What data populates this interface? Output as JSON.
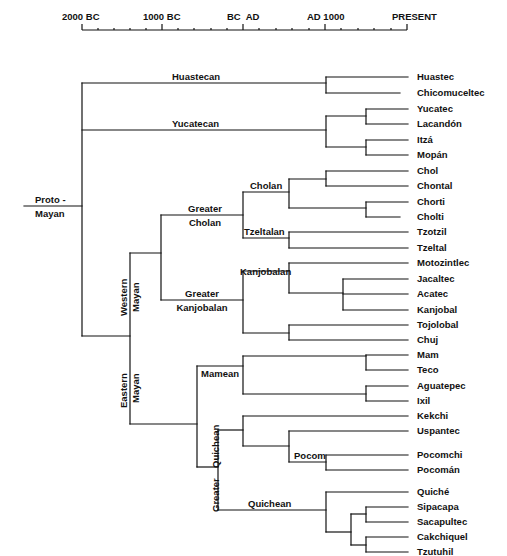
{
  "timeline": {
    "ticks": [
      {
        "label": "2000 BC",
        "x": 82
      },
      {
        "label": "1000 BC",
        "x": 162
      },
      {
        "label": "BC  AD",
        "x": 243
      },
      {
        "label": "AD 1000",
        "x": 325
      },
      {
        "label": "PRESENT",
        "x": 407
      }
    ],
    "minor_tick_count_per_interval": 5
  },
  "root": {
    "label_line1": "Proto -",
    "label_line2": "Mayan"
  },
  "branches": {
    "huastecan": "Huastecan",
    "yucatecan": "Yucatecan",
    "western_mayan_line1": "Western",
    "western_mayan_line2": "Mayan",
    "eastern_mayan_line1": "Eastern",
    "eastern_mayan_line2": "Mayan",
    "greater_cholan_line1": "Greater",
    "greater_cholan_line2": "Cholan",
    "cholan": "Cholan",
    "tzeltalan": "Tzeltalan",
    "greater_kanjobalan_line1": "Greater",
    "greater_kanjobalan_line2": "Kanjobalan",
    "kanjobalan": "Kanjobalan",
    "mamean": "Mamean",
    "greater_quichean_line1": "Greater",
    "greater_quichean_line2": "Quichean",
    "pocom": "Pocom",
    "quichean": "Quichean"
  },
  "languages": [
    {
      "name": "Huastec",
      "y": 77
    },
    {
      "name": "Chicomuceltec",
      "y": 93
    },
    {
      "name": "Yucatec",
      "y": 109
    },
    {
      "name": "Lacandón",
      "y": 124
    },
    {
      "name": "Itzá",
      "y": 140
    },
    {
      "name": "Mopán",
      "y": 155
    },
    {
      "name": "Chol",
      "y": 171
    },
    {
      "name": "Chontal",
      "y": 186
    },
    {
      "name": "Chorti",
      "y": 202
    },
    {
      "name": "Cholti",
      "y": 217
    },
    {
      "name": "Tzotzil",
      "y": 232
    },
    {
      "name": "Tzeltal",
      "y": 248
    },
    {
      "name": "Motozintlec",
      "y": 263
    },
    {
      "name": "Jacaltec",
      "y": 279
    },
    {
      "name": "Acatec",
      "y": 294
    },
    {
      "name": "Kanjobal",
      "y": 310
    },
    {
      "name": "Tojolobal",
      "y": 325
    },
    {
      "name": "Chuj",
      "y": 340
    },
    {
      "name": "Mam",
      "y": 355
    },
    {
      "name": "Teco",
      "y": 370
    },
    {
      "name": "Aguatepec",
      "y": 386
    },
    {
      "name": "Ixil",
      "y": 401
    },
    {
      "name": "Kekchi",
      "y": 416
    },
    {
      "name": "Uspantec",
      "y": 431
    },
    {
      "name": "Pocomchi",
      "y": 455
    },
    {
      "name": "Pocomán",
      "y": 470
    },
    {
      "name": "Quiché",
      "y": 492
    },
    {
      "name": "Sipacapa",
      "y": 507
    },
    {
      "name": "Sacapultec",
      "y": 522
    },
    {
      "name": "Cakchiquel",
      "y": 537
    },
    {
      "name": "Tzutuhil",
      "y": 552
    }
  ]
}
